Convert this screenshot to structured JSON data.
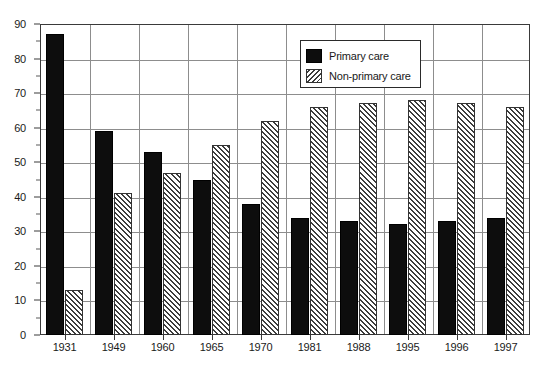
{
  "chart_data": {
    "type": "bar",
    "title": "",
    "xlabel": "",
    "ylabel": "",
    "ylim": [
      0,
      90
    ],
    "ytick_step": 10,
    "grid": true,
    "legend_position": "top-right",
    "categories": [
      "1931",
      "1949",
      "1960",
      "1965",
      "1970",
      "1981",
      "1988",
      "1995",
      "1996",
      "1997"
    ],
    "ytick_labels": [
      "0",
      "10",
      "20",
      "30",
      "40",
      "50",
      "60",
      "70",
      "80",
      "90"
    ],
    "series": [
      {
        "name": "Primary care",
        "fill": "solid-black",
        "color": "#0d0d0d",
        "values": [
          87,
          59,
          53,
          45,
          38,
          34,
          33,
          32,
          33,
          34
        ]
      },
      {
        "name": "Non-primary care",
        "fill": "diagonal-hatch",
        "color": "#ffffff",
        "values": [
          13,
          41,
          47,
          55,
          62,
          66,
          67,
          68,
          67,
          66
        ]
      }
    ]
  },
  "legend": {
    "items": [
      {
        "label": "Primary care",
        "swatch": "solid-black-swatch"
      },
      {
        "label": "Non-primary care",
        "swatch": "hatched-swatch"
      }
    ]
  }
}
